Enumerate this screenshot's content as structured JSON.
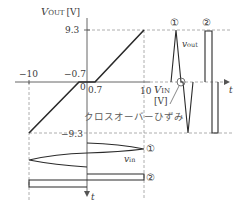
{
  "figure": {
    "y_axis_label": "V",
    "y_axis_label_sub": "OUT",
    "y_axis_unit": "[V]",
    "x_axis_label": "V",
    "x_axis_label_sub": "IN",
    "x_axis_unit": "[V]",
    "time_label": "t",
    "time_label_down": "t",
    "tick_pos_93": "9.3",
    "tick_neg_93": "−9.3",
    "tick_neg_10": "−10",
    "tick_neg_07": "−0.7",
    "tick_zero": "0",
    "tick_pos_07": "0.7",
    "tick_pos_10": "10",
    "vout_label": "v",
    "vout_label_sub": "out",
    "vin_label": "v",
    "vin_label_sub": "in",
    "marker_1": "①",
    "marker_2": "②",
    "crossover_label": "クロスオーバーひずみ"
  },
  "colors": {
    "curve": "#2a2a2a",
    "axis": "#555555",
    "dashed": "#9a9a9a",
    "text": "#3a3a3a"
  }
}
